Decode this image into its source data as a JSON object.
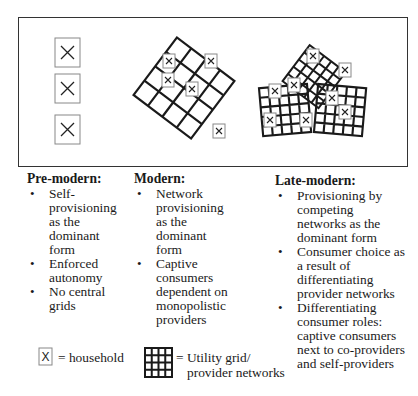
{
  "diagram": {
    "stages": [
      {
        "title": "Pre-modern:",
        "bullets": [
          "Self-provisioning as the dominant form",
          "Enforced autonomy",
          "No central grids"
        ]
      },
      {
        "title": "Modern:",
        "bullets": [
          "Network provisioning as the dominant form",
          "Captive consumers dependent on monopolistic providers"
        ]
      },
      {
        "title": "Late-modern:",
        "bullets": [
          "Provisioning by competing networks as the dominant form",
          "Consumer choice as a result of differentiating provider networks",
          "Differentiating consumer roles: captive consumers next to co-providers and self-providers"
        ]
      }
    ],
    "legend": {
      "household_symbol": "X",
      "household_label": "= household",
      "grid_label_line1": "= Utility grid/",
      "grid_label_line2": "provider networks"
    },
    "colors": {
      "line": "#1a1a1a",
      "house_border": "#888888"
    }
  }
}
